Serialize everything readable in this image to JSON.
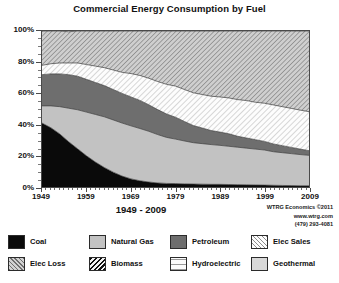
{
  "chart_data": {
    "type": "area",
    "title": "Commercial Energy Consumption by Fuel",
    "subtitle": "1949 - 2009",
    "xlabel": "",
    "ylabel": "",
    "stacked": true,
    "normalized_percent": true,
    "grid": false,
    "legend_position": "bottom",
    "xlim": [
      1949,
      2009
    ],
    "ylim": [
      0,
      100
    ],
    "xticks": [
      1949,
      1959,
      1969,
      1979,
      1989,
      1999,
      2009
    ],
    "xtick_labels": [
      "1949",
      "1959",
      "1969",
      "1979",
      "1989",
      "1999",
      "2009"
    ],
    "yticks": [
      0,
      20,
      40,
      60,
      80,
      100
    ],
    "ytick_labels": [
      "0%",
      "20%",
      "40%",
      "60%",
      "80%",
      "100%"
    ],
    "x": [
      1949,
      1951,
      1953,
      1955,
      1957,
      1959,
      1961,
      1963,
      1965,
      1967,
      1969,
      1971,
      1973,
      1975,
      1977,
      1979,
      1981,
      1983,
      1985,
      1987,
      1989,
      1991,
      1993,
      1995,
      1997,
      1999,
      2001,
      2003,
      2005,
      2007,
      2009
    ],
    "series": [
      {
        "name": "Coal",
        "color": "#0a0a0a",
        "pattern": "solid",
        "values": [
          41.0,
          38.0,
          34.0,
          29.0,
          24.5,
          20.0,
          16.0,
          12.5,
          9.5,
          7.0,
          5.2,
          4.0,
          3.2,
          2.6,
          2.3,
          2.2,
          2.0,
          1.9,
          1.8,
          1.7,
          1.7,
          1.6,
          1.5,
          1.4,
          1.3,
          1.2,
          1.1,
          1.0,
          0.9,
          0.8,
          0.8
        ]
      },
      {
        "name": "Natural Gas",
        "color": "#c2c2c2",
        "pattern": "solid",
        "values": [
          11.0,
          14.0,
          17.5,
          21.5,
          25.0,
          28.0,
          30.5,
          32.5,
          33.5,
          34.0,
          34.0,
          33.5,
          32.5,
          31.0,
          29.5,
          28.5,
          27.5,
          26.5,
          26.0,
          25.5,
          25.0,
          24.5,
          24.0,
          23.5,
          23.0,
          22.5,
          21.5,
          21.0,
          20.5,
          20.0,
          19.5
        ]
      },
      {
        "name": "Petroleum",
        "color": "#6e6e6e",
        "pattern": "solid",
        "values": [
          20.0,
          20.5,
          21.0,
          21.5,
          21.5,
          21.0,
          20.5,
          20.0,
          19.5,
          19.0,
          18.5,
          18.0,
          17.0,
          16.0,
          15.0,
          14.0,
          12.5,
          11.0,
          10.0,
          9.0,
          8.5,
          8.0,
          7.0,
          6.5,
          6.0,
          5.5,
          5.0,
          4.5,
          4.0,
          3.5,
          3.0
        ]
      },
      {
        "name": "Elec Sales",
        "color": "#fdfdfd",
        "pattern": "diagonal-light",
        "values": [
          6.0,
          6.5,
          7.0,
          7.5,
          8.5,
          9.5,
          10.5,
          11.5,
          12.5,
          13.5,
          15.0,
          16.0,
          17.0,
          18.0,
          19.0,
          20.0,
          20.5,
          21.0,
          21.5,
          22.0,
          22.5,
          23.0,
          23.5,
          24.0,
          24.0,
          24.5,
          25.0,
          25.0,
          25.0,
          25.0,
          25.0
        ]
      },
      {
        "name": "Elec Loss",
        "color": "#b9b9b9",
        "pattern": "diagonal-dark",
        "values": [
          22.0,
          21.0,
          20.5,
          20.0,
          20.5,
          21.5,
          22.5,
          23.5,
          25.0,
          26.5,
          27.3,
          28.5,
          30.3,
          32.4,
          34.2,
          35.3,
          37.5,
          39.6,
          40.7,
          41.8,
          42.3,
          42.9,
          44.0,
          44.6,
          45.7,
          46.3,
          47.4,
          48.5,
          49.6,
          50.7,
          51.7
        ]
      },
      {
        "name": "Biomass",
        "color": "#f2f2f2",
        "pattern": "diagonal-hatch-dark",
        "values": [
          0.0,
          0.0,
          0.0,
          0.0,
          0.0,
          0.0,
          0.0,
          0.0,
          0.0,
          0.0,
          0.0,
          0.0,
          0.0,
          0.0,
          0.0,
          0.0,
          0.0,
          0.0,
          0.0,
          0.0,
          0.0,
          0.0,
          0.0,
          0.0,
          0.0,
          0.0,
          0.0,
          0.0,
          0.0,
          0.0,
          0.0
        ]
      },
      {
        "name": "Hydroelectric",
        "color": "#fbfbfb",
        "pattern": "wavy",
        "values": [
          0.0,
          0.0,
          0.0,
          0.0,
          0.0,
          0.0,
          0.0,
          0.0,
          0.0,
          0.0,
          0.0,
          0.0,
          0.0,
          0.0,
          0.0,
          0.0,
          0.0,
          0.0,
          0.0,
          0.0,
          0.0,
          0.0,
          0.0,
          0.0,
          0.0,
          0.0,
          0.0,
          0.0,
          0.0,
          0.0,
          0.0
        ]
      },
      {
        "name": "Geothermal",
        "color": "#d8d8d8",
        "pattern": "solid",
        "values": [
          0.0,
          0.0,
          0.0,
          0.0,
          0.0,
          0.0,
          0.0,
          0.0,
          0.0,
          0.0,
          0.0,
          0.0,
          0.0,
          0.0,
          0.0,
          0.0,
          0.0,
          0.0,
          0.0,
          0.0,
          0.0,
          0.0,
          0.0,
          0.0,
          0.0,
          0.0,
          0.0,
          0.0,
          0.0,
          0.0,
          0.0
        ]
      }
    ]
  },
  "legend": {
    "row1": [
      {
        "label": "Coal",
        "swatch": "sw-coal"
      },
      {
        "label": "Natural Gas",
        "swatch": "sw-gas"
      },
      {
        "label": "Petroleum",
        "swatch": "sw-petro"
      },
      {
        "label": "Elec Sales",
        "swatch": "sw-elecsales"
      }
    ],
    "row2": [
      {
        "label": "Elec Loss",
        "swatch": "sw-elecloss"
      },
      {
        "label": "Biomass",
        "swatch": "sw-biomass"
      },
      {
        "label": "Hydroelectric",
        "swatch": "sw-hydro"
      },
      {
        "label": "Geothermal",
        "swatch": "sw-geo"
      }
    ]
  },
  "credit": {
    "line1": "WTRG Economics ©2011",
    "line2": "www.wtrg.com",
    "line3": "(479) 293-4081"
  }
}
